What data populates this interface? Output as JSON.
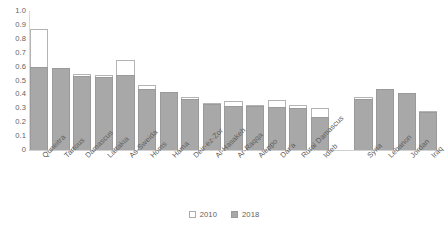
{
  "chart_data": {
    "type": "bar",
    "title": "",
    "subtitle": "",
    "xlabel": "",
    "ylabel": "",
    "ylim": [
      0,
      1.0
    ],
    "ytick_labels": [
      "1.0",
      "0.9",
      "0.8",
      "0.7",
      "0.6",
      "0.5",
      "0.4",
      "0.3",
      "0.2",
      "0.1",
      "0"
    ],
    "ytick_values": [
      1.0,
      0.9,
      0.8,
      0.7,
      0.6,
      0.5,
      0.4,
      0.3,
      0.2,
      0.1,
      0
    ],
    "grid": false,
    "legend_position": "bottom-center",
    "stacked": false,
    "overlay": true,
    "categories": [
      "Quneitra",
      "Tartous",
      "Damascus",
      "Lattakia",
      "As-Sweida",
      "Homs",
      "Hama",
      "Deir-ez-Zor",
      "Al-Hasakeh",
      "Ar-Raqqa",
      "Aleppo",
      "Dar'a",
      "Rural Damascus",
      "Idleb",
      "Syria",
      "Lebanon",
      "Jordan",
      "Iraq"
    ],
    "group_break_after": "Idleb",
    "series": [
      {
        "name": "2010",
        "color": "#ffffff",
        "edge_color": "#b4b4b4",
        "values": [
          0.87,
          0.59,
          0.545,
          0.54,
          0.65,
          0.47,
          0.42,
          0.385,
          0.335,
          0.355,
          0.325,
          0.36,
          0.325,
          0.3,
          0.385,
          0.44,
          0.41,
          0.28
        ]
      },
      {
        "name": "2018",
        "color": "#a8a8a8",
        "edge_color": "#9a9a9a",
        "values": [
          0.6,
          0.59,
          0.53,
          0.525,
          0.54,
          0.44,
          0.415,
          0.365,
          0.33,
          0.315,
          0.315,
          0.31,
          0.3,
          0.235,
          0.37,
          0.44,
          0.41,
          0.275
        ]
      }
    ]
  },
  "legend": {
    "items": [
      {
        "label": "2010",
        "swatch": "legend-swatch-2010"
      },
      {
        "label": "2018",
        "swatch": "legend-swatch-2018"
      }
    ]
  }
}
